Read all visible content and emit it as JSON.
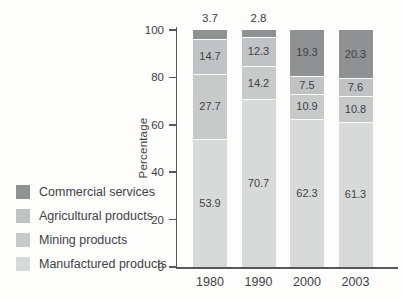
{
  "chart_data": {
    "type": "bar",
    "stacked": true,
    "title": "",
    "xlabel": "",
    "ylabel": "Percentage",
    "ylim": [
      0,
      100
    ],
    "yticks": [
      0,
      20,
      40,
      60,
      80,
      100
    ],
    "grid": false,
    "legend_position": "left",
    "categories": [
      "1980",
      "1990",
      "2000",
      "2003"
    ],
    "series": [
      {
        "name": "Manufactured products",
        "color": "#d8dad9",
        "values": [
          53.9,
          70.7,
          62.3,
          61.3
        ]
      },
      {
        "name": "Mining products",
        "color": "#c8caca",
        "values": [
          27.7,
          14.2,
          10.9,
          10.8
        ]
      },
      {
        "name": "Agricultural products",
        "color": "#c0c2c3",
        "values": [
          14.7,
          12.3,
          7.5,
          7.6
        ]
      },
      {
        "name": "Commercial services",
        "color": "#8f9192",
        "values": [
          3.7,
          2.8,
          19.3,
          20.3
        ]
      }
    ],
    "value_labels": true,
    "small_segment_labels_above_bar": [
      "1980",
      "1990"
    ]
  },
  "legend": {
    "items": [
      {
        "label": "Commercial services",
        "color": "#8f9192"
      },
      {
        "label": "Agricultural products",
        "color": "#c0c2c3"
      },
      {
        "label": "Mining products",
        "color": "#c8caca"
      },
      {
        "label": "Manufactured products",
        "color": "#d8dad9"
      }
    ]
  },
  "colors": {
    "axis": "#55575a",
    "text": "#414244",
    "separator": "#fbfbfa",
    "background": "#fdfdfc"
  }
}
